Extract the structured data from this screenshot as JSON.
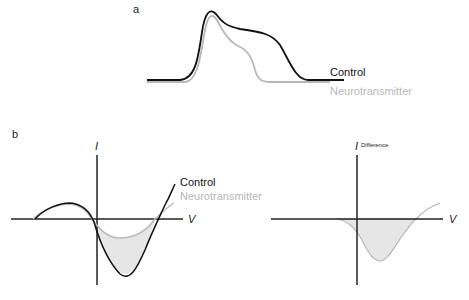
{
  "panel_a": {
    "label": "a",
    "legend": {
      "control": "Control",
      "neurotransmitter": "Neurotransmitter"
    }
  },
  "panel_b_left": {
    "label": "b",
    "y_axis_label": "I",
    "x_axis_label": "V",
    "legend": {
      "control": "Control",
      "neurotransmitter": "Neurotransmitter"
    }
  },
  "panel_b_right": {
    "y_axis_label": "I",
    "y_axis_subscript": "Difference",
    "x_axis_label": "V"
  },
  "colors": {
    "control": "#111111",
    "neurotransmitter": "#b8b8b8",
    "fill": "#e6e6e6",
    "axis": "#222222"
  }
}
